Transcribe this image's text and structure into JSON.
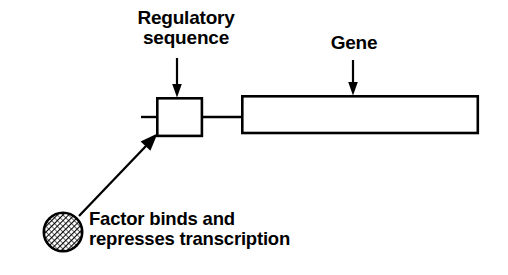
{
  "diagram": {
    "type": "schematic",
    "background_color": "#ffffff",
    "stroke_color": "#000000",
    "labels": {
      "regulatory_sequence": "Regulatory\nsequence",
      "regulatory_sequence_line1": "Regulatory",
      "regulatory_sequence_line2": "sequence",
      "gene": "Gene",
      "factor_caption_line1": "Factor binds and",
      "factor_caption_line2": "represses transcription"
    },
    "elements": {
      "regulatory_box": {
        "name": "regulatory-sequence-box",
        "shape": "rectangle",
        "x": 157,
        "y": 98,
        "width": 45,
        "height": 38,
        "fill": "#ffffff",
        "stroke": "#000000",
        "stroke_width": 2.6
      },
      "gene_box": {
        "name": "gene-box",
        "shape": "rectangle",
        "x": 242,
        "y": 96,
        "width": 236,
        "height": 37,
        "fill": "#ffffff",
        "stroke": "#000000",
        "stroke_width": 2.6
      },
      "left_stub": {
        "name": "upstream-dna-stub",
        "shape": "line",
        "x1": 141,
        "y1": 117,
        "x2": 157,
        "y2": 117,
        "stroke_width": 2.4
      },
      "connector": {
        "name": "dna-connector-line",
        "shape": "line",
        "x1": 202,
        "y1": 117,
        "x2": 242,
        "y2": 117,
        "stroke_width": 2.4
      },
      "regulatory_arrow": {
        "name": "regulatory-sequence-pointer-arrow",
        "shape": "arrow",
        "x1": 177,
        "y1": 58,
        "x2": 177,
        "y2": 96,
        "direction": "down"
      },
      "gene_arrow": {
        "name": "gene-pointer-arrow",
        "shape": "arrow",
        "x1": 353,
        "y1": 60,
        "x2": 353,
        "y2": 94,
        "direction": "down"
      },
      "factor_arrow": {
        "name": "factor-binding-arrow",
        "shape": "arrow",
        "x1": 78,
        "y1": 216,
        "x2": 157,
        "y2": 134,
        "direction": "up-right"
      },
      "factor_circle": {
        "name": "repressor-factor-circle",
        "shape": "circle",
        "cx": 63,
        "cy": 232,
        "r": 20,
        "fill_pattern": "diagonal-crosshatch",
        "stroke": "#000000",
        "stroke_width": 2.4
      }
    }
  }
}
